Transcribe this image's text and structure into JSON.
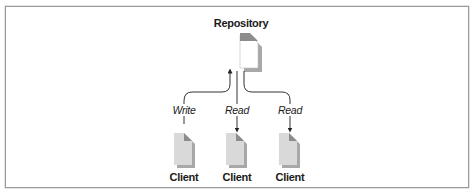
{
  "diagram": {
    "repository": {
      "label": "Repository"
    },
    "clients": [
      {
        "label": "Client",
        "operation": "Write",
        "direction": "to-repository"
      },
      {
        "label": "Client",
        "operation": "Read",
        "direction": "from-repository"
      },
      {
        "label": "Client",
        "operation": "Read",
        "direction": "from-repository"
      }
    ],
    "colors": {
      "frame": "#9a9a9a",
      "document_fill_repository": "#ffffff",
      "document_fill_client": "#d9d9d9",
      "document_fold": "#8c8c8c",
      "document_shadow": "#a8a8a8",
      "connector": "#333333",
      "text": "#1a1a1a"
    }
  }
}
